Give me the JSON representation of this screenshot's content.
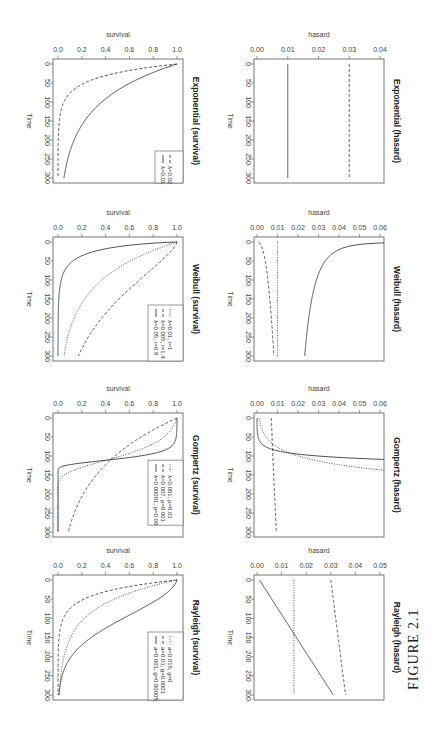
{
  "figure_label": "FIGURE 2.1",
  "orientation": "rotated 90 degrees clockwise (landscape figure on portrait page)",
  "chart_data": [
    {
      "type": "line",
      "title": "Exponential (survival)",
      "xlabel": "Time",
      "ylabel": "survival",
      "xlim": [
        0,
        300
      ],
      "ylim": [
        0,
        1
      ],
      "x_ticks": [
        "0",
        "50",
        "100",
        "150",
        "200",
        "250",
        "300"
      ],
      "y_ticks": [
        "0.0",
        "0.2",
        "0.4",
        "0.6",
        "0.8",
        "1.0"
      ],
      "legend_position": "bottomright",
      "series": [
        {
          "name": "λ=0.01",
          "style": "solid",
          "model": "exp",
          "params": {
            "lambda": 0.01
          },
          "x": [
            0,
            50,
            100,
            150,
            200,
            250,
            300
          ],
          "values": [
            1.0,
            0.61,
            0.37,
            0.22,
            0.14,
            0.08,
            0.05
          ]
        },
        {
          "name": "λ=0.02",
          "style": "dashed",
          "model": "exp",
          "params": {
            "lambda": 0.03
          },
          "x": [
            0,
            50,
            100,
            150,
            200,
            250,
            300
          ],
          "values": [
            1.0,
            0.22,
            0.05,
            0.01,
            0.0,
            0.0,
            0.0
          ]
        }
      ]
    },
    {
      "type": "line",
      "title": "Exponential (hasard)",
      "xlabel": "Time",
      "ylabel": "hasard",
      "xlim": [
        0,
        300
      ],
      "ylim": [
        0,
        0.04
      ],
      "x_ticks": [
        "0",
        "50",
        "100",
        "150",
        "200",
        "250",
        "300"
      ],
      "y_ticks": [
        "0.00",
        "0.01",
        "0.02",
        "0.03",
        "0.04"
      ],
      "series": [
        {
          "name": "λ=0.01",
          "style": "solid",
          "model": "exp_h",
          "params": {
            "lambda": 0.01
          },
          "x": [
            0,
            300
          ],
          "values": [
            0.01,
            0.01
          ]
        },
        {
          "name": "λ=0.03",
          "style": "dashed",
          "model": "exp_h",
          "params": {
            "lambda": 0.03
          },
          "x": [
            0,
            300
          ],
          "values": [
            0.03,
            0.03
          ]
        }
      ]
    },
    {
      "type": "line",
      "title": "Weibull (survival)",
      "xlabel": "Time",
      "ylabel": "survival",
      "xlim": [
        0,
        300
      ],
      "ylim": [
        0,
        1
      ],
      "x_ticks": [
        "0",
        "50",
        "100",
        "150",
        "200",
        "250",
        "300"
      ],
      "y_ticks": [
        "0.0",
        "0.2",
        "0.4",
        "0.6",
        "0.8",
        "1.0"
      ],
      "legend_position": "bottomright",
      "series": [
        {
          "name": "λ=0.05, r=0.8",
          "style": "solid",
          "model": "weib",
          "params": {
            "lambda": 0.05,
            "r": 0.8
          },
          "x": [
            0,
            50,
            100,
            150,
            200,
            250,
            300
          ],
          "values": [
            1.0,
            0.33,
            0.16,
            0.09,
            0.05,
            0.03,
            0.02
          ]
        },
        {
          "name": "λ=0.005, r=1.4",
          "style": "dashed",
          "model": "weib",
          "params": {
            "lambda": 0.005,
            "r": 1.4
          },
          "x": [
            0,
            50,
            100,
            150,
            200,
            250,
            300
          ],
          "values": [
            1.0,
            0.33,
            0.07,
            0.01,
            0.0,
            0.0,
            0.0
          ]
        },
        {
          "name": "λ=0.01, r=1",
          "style": "dotted",
          "model": "weib",
          "params": {
            "lambda": 0.01,
            "r": 1
          },
          "x": [
            0,
            50,
            100,
            150,
            200,
            250,
            300
          ],
          "values": [
            1.0,
            0.61,
            0.37,
            0.22,
            0.14,
            0.08,
            0.05
          ]
        }
      ]
    },
    {
      "type": "line",
      "title": "Weibull (hasard)",
      "xlabel": "Time",
      "ylabel": "hasard",
      "xlim": [
        0,
        300
      ],
      "ylim": [
        0,
        0.06
      ],
      "x_ticks": [
        "0",
        "50",
        "100",
        "150",
        "200",
        "250",
        "300"
      ],
      "y_ticks": [
        "0.00",
        "0.01",
        "0.02",
        "0.03",
        "0.04",
        "0.05",
        "0.06"
      ],
      "series": [
        {
          "name": "λ=0.05, r=0.8",
          "style": "solid",
          "model": "weib_h",
          "params": {
            "lambda": 0.05,
            "r": 0.8
          },
          "x": [
            1,
            10,
            50,
            100,
            200,
            300
          ],
          "values": [
            0.04,
            0.025,
            0.018,
            0.016,
            0.014,
            0.013
          ]
        },
        {
          "name": "λ=0.005, r=1.4",
          "style": "dashed",
          "model": "weib_h",
          "params": {
            "lambda": 0.005,
            "r": 1.4
          },
          "x": [
            1,
            50,
            100,
            150,
            200,
            240
          ],
          "values": [
            0.008,
            0.027,
            0.036,
            0.043,
            0.05,
            0.062
          ]
        },
        {
          "name": "λ=0.01, r=1",
          "style": "dotted",
          "model": "weib_h",
          "params": {
            "lambda": 0.01,
            "r": 1
          },
          "x": [
            0,
            300
          ],
          "values": [
            0.01,
            0.01
          ]
        }
      ]
    },
    {
      "type": "line",
      "title": "Gompertz (survival)",
      "xlabel": "Time",
      "ylabel": "survival",
      "xlim": [
        0,
        300
      ],
      "ylim": [
        0,
        1
      ],
      "x_ticks": [
        "0",
        "50",
        "100",
        "150",
        "200",
        "250",
        "300"
      ],
      "y_ticks": [
        "0.0",
        "0.2",
        "0.4",
        "0.6",
        "0.8",
        "1.0"
      ],
      "legend_position": "topright",
      "series": [
        {
          "name": "λ=0.00001, ρ=0.08",
          "style": "solid",
          "model": "gomp",
          "params": {
            "lambda": 1e-05,
            "rho": 0.08
          },
          "x": [
            0,
            50,
            80,
            100,
            110,
            120,
            130,
            300
          ],
          "values": [
            1.0,
            0.99,
            0.93,
            0.72,
            0.45,
            0.12,
            0.01,
            0.0
          ]
        },
        {
          "name": "λ=0.007, ρ=0.001",
          "style": "dashed",
          "model": "gomp",
          "params": {
            "lambda": 0.007,
            "rho": 0.001
          },
          "x": [
            0,
            50,
            100,
            150,
            200,
            250,
            300
          ],
          "values": [
            1.0,
            0.7,
            0.48,
            0.32,
            0.21,
            0.13,
            0.08
          ]
        },
        {
          "name": "λ=0.001, ρ=0.03",
          "style": "dotted",
          "model": "gomp",
          "params": {
            "lambda": 0.001,
            "rho": 0.03
          },
          "x": [
            0,
            50,
            100,
            150,
            200,
            250,
            300
          ],
          "values": [
            1.0,
            0.99,
            0.91,
            0.57,
            0.11,
            0.0,
            0.0
          ]
        }
      ]
    },
    {
      "type": "line",
      "title": "Gompertz (hasard)",
      "xlabel": "Time",
      "ylabel": "hasard",
      "xlim": [
        0,
        300
      ],
      "ylim": [
        0,
        0.06
      ],
      "x_ticks": [
        "0",
        "50",
        "100",
        "150",
        "200",
        "250",
        "300"
      ],
      "y_ticks": [
        "0.00",
        "0.01",
        "0.02",
        "0.03",
        "0.04",
        "0.05",
        "0.06"
      ],
      "series": [
        {
          "name": "λ=0.00001, ρ=0.08",
          "style": "solid",
          "model": "gomp_h",
          "params": {
            "lambda": 1e-05,
            "rho": 0.08
          },
          "x": [
            0,
            50,
            80,
            100,
            110
          ],
          "values": [
            1e-05,
            0.0005,
            0.006,
            0.03,
            0.066
          ]
        },
        {
          "name": "λ=0.007, ρ=0.001",
          "style": "dashed",
          "model": "gomp_h",
          "params": {
            "lambda": 0.007,
            "rho": 0.001
          },
          "x": [
            0,
            150,
            300
          ],
          "values": [
            0.007,
            0.0081,
            0.0094
          ]
        },
        {
          "name": "λ=0.001, ρ=0.03",
          "style": "dotted",
          "model": "gomp_h",
          "params": {
            "lambda": 0.001,
            "rho": 0.03
          },
          "x": [
            0,
            50,
            100,
            150,
            200,
            215
          ],
          "values": [
            0.001,
            0.0045,
            0.02,
            0.09,
            0.4,
            0.064
          ]
        }
      ]
    },
    {
      "type": "line",
      "title": "Rayleigh (survival)",
      "xlabel": "Time",
      "ylabel": "survival",
      "xlim": [
        0,
        300
      ],
      "ylim": [
        0,
        1
      ],
      "x_ticks": [
        "0",
        "50",
        "100",
        "150",
        "200",
        "250",
        "300"
      ],
      "y_ticks": [
        "0.0",
        "0.2",
        "0.4",
        "0.6",
        "0.8",
        "1.0"
      ],
      "legend_position": "bottomright",
      "series": [
        {
          "name": "a=0.001, g=0.00005",
          "style": "solid",
          "model": "rayl",
          "params": {
            "a": 0.001,
            "g": 0.0001
          },
          "x": [
            0,
            50,
            100,
            150,
            200,
            250,
            300
          ],
          "values": [
            1.0,
            0.84,
            0.55,
            0.29,
            0.12,
            0.04,
            0.01
          ]
        },
        {
          "name": "a=0.03, g=0.0001",
          "style": "dashed",
          "model": "rayl",
          "params": {
            "a": 0.03,
            "g": 2e-05
          },
          "x": [
            0,
            50,
            100,
            150,
            200,
            250,
            300
          ],
          "values": [
            1.0,
            0.22,
            0.05,
            0.01,
            0.0,
            0.0,
            0.0
          ]
        },
        {
          "name": "a=0.015, g=0",
          "style": "dotted",
          "model": "rayl",
          "params": {
            "a": 0.015,
            "g": 0
          },
          "x": [
            0,
            50,
            100,
            150,
            200,
            250,
            300
          ],
          "values": [
            1.0,
            0.47,
            0.22,
            0.11,
            0.05,
            0.02,
            0.01
          ]
        }
      ]
    },
    {
      "type": "line",
      "title": "Rayleigh (hasard)",
      "xlabel": "Time",
      "ylabel": "hasard",
      "xlim": [
        0,
        300
      ],
      "ylim": [
        0,
        0.05
      ],
      "x_ticks": [
        "0",
        "50",
        "100",
        "150",
        "200",
        "250",
        "300"
      ],
      "y_ticks": [
        "0.00",
        "0.01",
        "0.02",
        "0.03",
        "0.04",
        "0.05"
      ],
      "series": [
        {
          "name": "a=0.001, g=0.0001",
          "style": "solid",
          "model": "rayl_h",
          "params": {
            "a": 0.001,
            "g": 0.0001
          },
          "x": [
            0,
            300
          ],
          "values": [
            0.001,
            0.031
          ]
        },
        {
          "name": "a=0.03, g=0.00002",
          "style": "dashed",
          "model": "rayl_h",
          "params": {
            "a": 0.03,
            "g": 2e-05
          },
          "x": [
            0,
            300
          ],
          "values": [
            0.03,
            0.036
          ]
        },
        {
          "name": "a=0.015, g=0",
          "style": "dotted",
          "model": "rayl_h",
          "params": {
            "a": 0.015,
            "g": 0
          },
          "x": [
            0,
            300
          ],
          "values": [
            0.015,
            0.015
          ]
        }
      ]
    }
  ]
}
